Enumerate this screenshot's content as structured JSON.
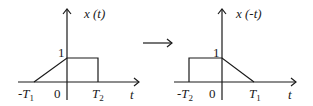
{
  "left_plot": {
    "ylabel": "x (t)",
    "xlabel": "t",
    "level_label": "1",
    "origin_label": "0",
    "neg_tick": {
      "prefix": "-T",
      "sub": "1"
    },
    "pos_tick": {
      "prefix": "T",
      "sub": "2"
    }
  },
  "arrow": "→",
  "right_plot": {
    "ylabel": "x (-t)",
    "xlabel": "t",
    "level_label": "1",
    "origin_label": "0",
    "neg_tick": {
      "prefix": "-T",
      "sub": "2"
    },
    "pos_tick": {
      "prefix": "T",
      "sub": "1"
    }
  },
  "colors": {
    "stroke": "#1a1a1a",
    "background": "#ffffff"
  }
}
